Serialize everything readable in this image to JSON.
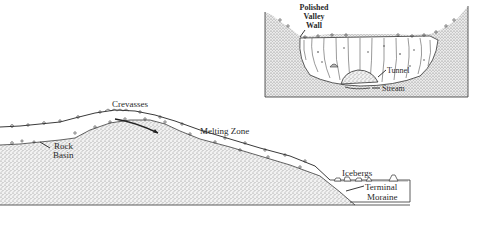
{
  "colors": {
    "background": "#ffffff",
    "stipple": "#8c8c8c",
    "stipple_dark": "#5a5a5a",
    "line": "#2a2a2a",
    "ice": "#ffffff"
  },
  "main_diagram": {
    "labels": {
      "crevasses": "Crevasses",
      "melting_zone": "Melting Zone",
      "rock_basin_line1": "Rock",
      "rock_basin_line2": "Basin",
      "icebergs": "Icebergs",
      "terminal_moraine_line1": "Terminal",
      "terminal_moraine_line2": "Moraine"
    }
  },
  "inset_diagram": {
    "labels": {
      "polished_line1": "Polished",
      "polished_line2": "Valley",
      "polished_line3": "Wall",
      "tunnel": "Tunnel",
      "stream": "Stream"
    }
  }
}
